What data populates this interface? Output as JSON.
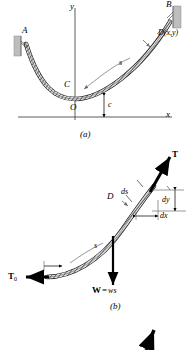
{
  "figure": {
    "type": "catenary-cable-diagram",
    "panels": [
      {
        "id": "a",
        "caption": "(a)",
        "labels": {
          "point_a": "A",
          "point_b": "B",
          "point_c": "C",
          "origin": "O",
          "point_d": "D(x,y)",
          "arc_length": "s",
          "sag_param": "c",
          "axis_x": "x",
          "axis_y": "y"
        },
        "icons": {
          "wall_left": "hatched-wall-support-icon",
          "wall_right": "hatched-wall-support-icon",
          "cable": "cable-chain-icon"
        }
      },
      {
        "id": "b",
        "caption": "(b)",
        "labels": {
          "tension": "T",
          "tension_zero": "T",
          "tension_zero_sub": "0",
          "theta": "θ",
          "point_c": "C",
          "point_d": "D",
          "arc_length": "s",
          "diff_s": "ds",
          "diff_x": "dx",
          "diff_y": "dy",
          "weight": "W",
          "weight_eq": "=",
          "weight_val": "ws"
        },
        "icons": {
          "tension_arrow": "tension-vector-arrow-icon",
          "tension_zero_arrow": "horizontal-tension-arrow-icon",
          "weight_arrow": "weight-vector-arrow-icon",
          "cable": "cable-chain-icon"
        }
      }
    ],
    "cropped_bottom_element": {
      "icon": "partial-arrow-icon"
    }
  },
  "colors": {
    "ink": "#000000",
    "axis": "#4a4a4a",
    "cable_fill": "#d9d9d9",
    "wall_fill": "#c0c0c0",
    "leader": "#707070"
  }
}
